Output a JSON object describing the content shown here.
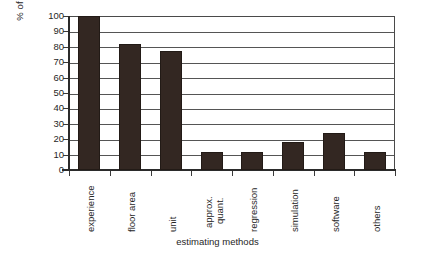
{
  "chart_data": {
    "type": "bar",
    "title": "",
    "xlabel": "estimating methods",
    "ylabel": "% of respondents",
    "categories": [
      "experience",
      "floor area",
      "unit",
      "approx. quant.",
      "regression",
      "simulation",
      "software",
      "others"
    ],
    "values": [
      100,
      82,
      77,
      12,
      12,
      18,
      24,
      12
    ],
    "ylim": [
      0,
      100
    ],
    "yticks": [
      0,
      10,
      20,
      30,
      40,
      50,
      60,
      70,
      80,
      90,
      100
    ],
    "ytick_labels": [
      "0",
      "10",
      "20",
      "30",
      "40",
      "50",
      "60",
      "70",
      "80",
      "90",
      "100"
    ],
    "grid": "horizontal",
    "legend": "none",
    "bar_color": "#332722",
    "plot_border_color": "#4a4a4a",
    "background_color": "#ffffff"
  },
  "axis": {
    "y_title": "% of respondents",
    "x_title": "estimating methods"
  },
  "xlabels_multiline": {
    "approx_quant_line1": "approx.",
    "approx_quant_line2": "quant."
  }
}
